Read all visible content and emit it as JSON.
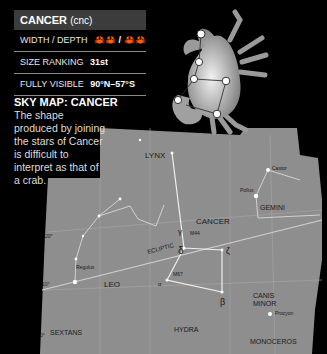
{
  "info_box": {
    "title": "CANCER",
    "abbreviation": "(cnc)",
    "rows": [
      {
        "label": "WIDTH / DEPTH",
        "value": "🦀🦀 / 🦀🦀"
      },
      {
        "label": "SIZE RANKING",
        "value": "31st"
      },
      {
        "label": "FULLY VISIBLE",
        "value": "90°N–57°S"
      }
    ]
  },
  "sky_map": {
    "heading": "SKY MAP: CANCER",
    "description": "The shape produced by joining the stars of Cancer is difficult to interpret as that of a crab."
  },
  "map_labels": {
    "constellations": [
      "LYNX",
      "CANCER",
      "GEMINI",
      "LEO",
      "CANIS MINOR",
      "HYDRA",
      "SEXTANS",
      "MONOCEROS"
    ],
    "stars": [
      "Castor",
      "Pollux",
      "Regulus",
      "Procyon"
    ],
    "objects": [
      "M44",
      "M67"
    ],
    "greek": [
      "γ",
      "δ",
      "ζ",
      "α",
      "β",
      "ι"
    ],
    "lines": [
      "ECLIPTIC"
    ],
    "declinations": [
      "20°",
      "10°",
      "0°"
    ]
  },
  "colors": {
    "background": "#000000",
    "map_fill": "#8c8c8c",
    "title_bar": "#3c3c3c"
  }
}
